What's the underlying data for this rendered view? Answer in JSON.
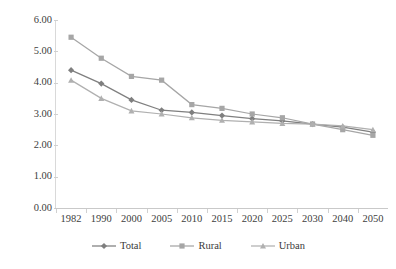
{
  "chart_data": {
    "type": "line",
    "title": "",
    "subtitle": "",
    "xlabel": "",
    "ylabel": "",
    "categories": [
      "1982",
      "1990",
      "2000",
      "2005",
      "2010",
      "2015",
      "2020",
      "2025",
      "2030",
      "2040",
      "2050"
    ],
    "ylim": [
      0.0,
      6.0
    ],
    "yticks": [
      0.0,
      1.0,
      2.0,
      3.0,
      4.0,
      5.0,
      6.0
    ],
    "ytick_labels": [
      "0.00",
      "1.00",
      "2.00",
      "3.00",
      "4.00",
      "5.00",
      "6.00"
    ],
    "grid": false,
    "legend_position": "bottom",
    "series": [
      {
        "name": "Total",
        "marker": "diamond",
        "color": "#7f7f7f",
        "values": [
          4.4,
          3.97,
          3.45,
          3.12,
          3.05,
          2.95,
          2.85,
          2.78,
          2.68,
          2.58,
          2.42
        ]
      },
      {
        "name": "Rural",
        "marker": "square",
        "color": "#a6a6a6",
        "values": [
          5.45,
          4.78,
          4.2,
          4.08,
          3.3,
          3.18,
          3.0,
          2.88,
          2.68,
          2.5,
          2.32
        ]
      },
      {
        "name": "Urban",
        "marker": "triangle",
        "color": "#b0b0b0",
        "values": [
          4.08,
          3.5,
          3.1,
          3.0,
          2.88,
          2.8,
          2.75,
          2.7,
          2.68,
          2.62,
          2.5
        ]
      }
    ]
  },
  "legend": {
    "items": [
      {
        "label": "Total"
      },
      {
        "label": "Rural"
      },
      {
        "label": "Urban"
      }
    ]
  },
  "axis": {
    "y_tick_labels": [
      "6.00",
      "5.00",
      "4.00",
      "3.00",
      "2.00",
      "1.00",
      "0.00"
    ],
    "x_tick_labels": [
      "1982",
      "1990",
      "2000",
      "2005",
      "2010",
      "2015",
      "2020",
      "2025",
      "2030",
      "2040",
      "2050"
    ]
  }
}
